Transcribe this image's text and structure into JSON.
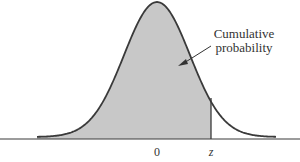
{
  "diagram": {
    "type": "standard-normal-curve",
    "annotation": {
      "line1": "Cumulative",
      "line2": "probability"
    },
    "axis_labels": {
      "mean": "0",
      "z": "z"
    },
    "colors": {
      "shade": "#c8c8c8",
      "curve": "#3a3a3a",
      "axis": "#3a3a3a",
      "background": "#ffffff"
    }
  },
  "chart_data": {
    "type": "area",
    "title": "",
    "x_tick_labels": [
      "0",
      "z"
    ],
    "shaded_region": "from -infinity to z",
    "annotation": "Cumulative probability",
    "grid": false
  }
}
